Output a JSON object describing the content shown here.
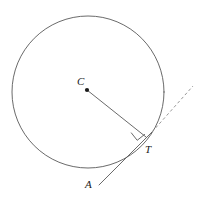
{
  "figure": {
    "type": "geometry-diagram",
    "background_color": "#ffffff",
    "stroke_color": "#595959",
    "label_color": "#1a1a1a",
    "width": 206,
    "height": 205
  },
  "labels": {
    "center": "C",
    "tangent_point": "T",
    "line_end": "A"
  },
  "elements": {
    "circle": {
      "name": "circle",
      "cx": 88,
      "cy": 92,
      "r": 76,
      "stroke": "#595959",
      "stroke_width": 0.9,
      "fill": "none"
    },
    "center_dot": {
      "name": "center-point",
      "cx": 87,
      "cy": 90,
      "r": 2.1,
      "fill": "#1a1a1a"
    },
    "radius_segment": {
      "name": "radius-CT",
      "x1": 87,
      "y1": 90,
      "x2": 146,
      "y2": 137,
      "stroke": "#595959",
      "stroke_width": 0.9
    },
    "tangent_solid": {
      "name": "tangent-AT",
      "x1": 99,
      "y1": 185,
      "x2": 152,
      "y2": 132,
      "stroke": "#595959",
      "stroke_width": 0.9
    },
    "tangent_dashed": {
      "name": "tangent-extension",
      "x1": 152,
      "y1": 132,
      "x2": 193,
      "y2": 86,
      "stroke": "#8c8c8c",
      "stroke_width": 0.9,
      "dash": "3 2.5"
    },
    "right_angle_marker": {
      "name": "right-angle-mark",
      "points": "131.1,132.6 137.2,140.3 144.9,134.2",
      "stroke": "#595959",
      "stroke_width": 0.9,
      "fill": "none"
    }
  }
}
